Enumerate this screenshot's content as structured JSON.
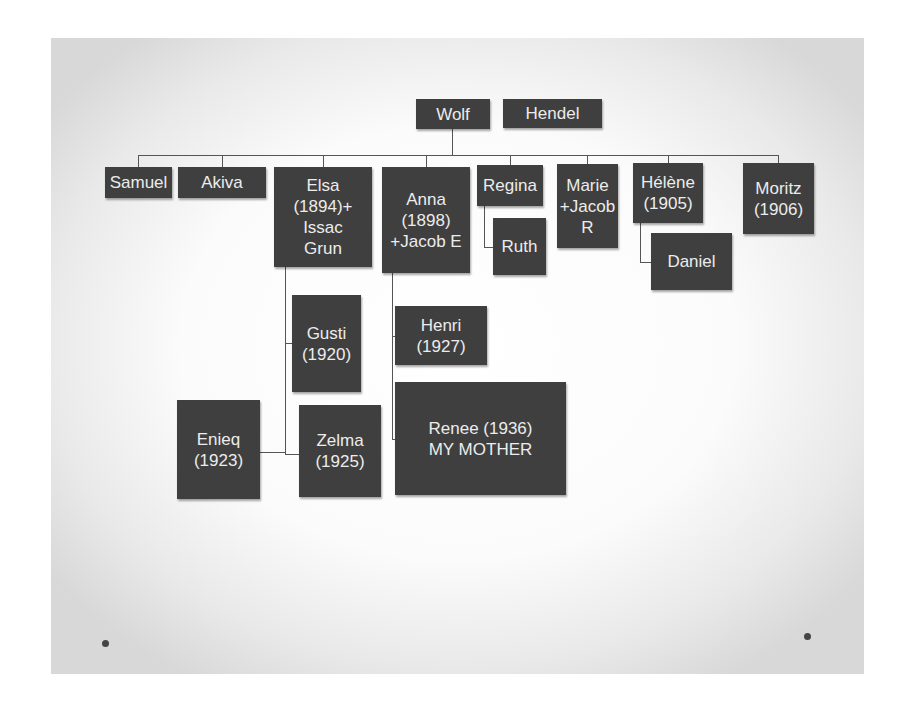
{
  "slide": {
    "bullets": [
      "•",
      "•"
    ]
  },
  "tree": {
    "parents": [
      {
        "id": "wolf",
        "label": "Wolf"
      },
      {
        "id": "hendel",
        "label": "Hendel"
      }
    ],
    "children": [
      {
        "id": "samuel",
        "label": "Samuel"
      },
      {
        "id": "akiva",
        "label": "Akiva"
      },
      {
        "id": "elsa",
        "label": "Elsa\n(1894)+\nIssac\nGrun"
      },
      {
        "id": "anna",
        "label": "Anna\n(1898)\n+Jacob E"
      },
      {
        "id": "regina",
        "label": "Regina"
      },
      {
        "id": "marie",
        "label": "Marie\n+Jacob\nR"
      },
      {
        "id": "helene",
        "label": "Hélène\n(1905)"
      },
      {
        "id": "moritz",
        "label": "Moritz\n(1906)"
      }
    ],
    "grandchildren": {
      "elsa": [
        {
          "id": "gusti",
          "label": "Gusti\n(1920)"
        },
        {
          "id": "zelma",
          "label": "Zelma\n(1925)"
        }
      ],
      "zelma_spouse": {
        "id": "enieq",
        "label": "Enieq\n(1923)"
      },
      "anna": [
        {
          "id": "henri",
          "label": "Henri\n(1927)"
        },
        {
          "id": "renee",
          "label": "Renee (1936)\nMY MOTHER"
        }
      ],
      "regina": [
        {
          "id": "ruth",
          "label": "Ruth"
        }
      ],
      "helene": [
        {
          "id": "daniel",
          "label": "Daniel"
        }
      ]
    }
  },
  "colors": {
    "node_fill": "#3f3f3f",
    "node_text": "#ececec",
    "connector": "#555555"
  }
}
